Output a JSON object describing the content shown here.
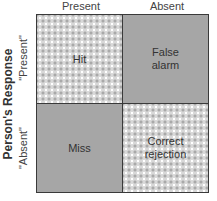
{
  "diagram": {
    "type": "signal-detection-matrix",
    "column_labels": [
      "Present",
      "Absent"
    ],
    "row_axis_title": "Person's Response",
    "row_labels": [
      "\"Present\"",
      "\"Absent\""
    ],
    "cells": {
      "present_present": "Hit",
      "present_absent_line1": "False",
      "present_absent_line2": "alarm",
      "absent_present": "Miss",
      "absent_absent_line1": "Correct",
      "absent_absent_line2": "rejection"
    },
    "colors": {
      "solid_fill": "#a6a6a6",
      "pattern_fill": "#d8d8d8",
      "border": "#3a3a3a"
    }
  }
}
